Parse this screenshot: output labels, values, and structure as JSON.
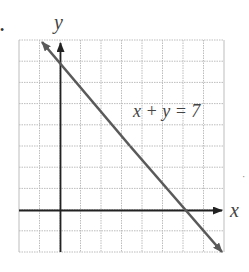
{
  "bullet": "•",
  "stray_mark": "·",
  "graph": {
    "x_axis_label": "x",
    "y_axis_label": "y",
    "equation_label": "x + y = 7",
    "x_range": [
      -2,
      8
    ],
    "y_range": [
      -2,
      8
    ],
    "grid_step": 1,
    "line": {
      "equation": "x + y = 7",
      "x_intercept": 7,
      "y_intercept": 7
    },
    "colors": {
      "grid": "#b5b5b5",
      "axes": "#222222",
      "line": "#5a5a5a"
    }
  }
}
